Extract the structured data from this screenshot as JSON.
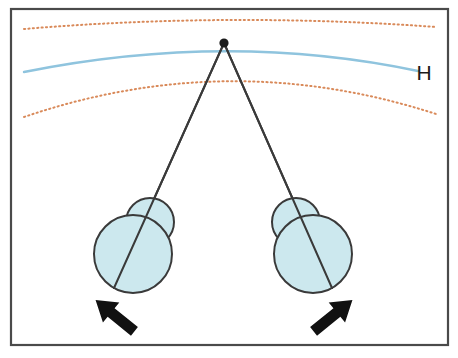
{
  "figure": {
    "type": "optical-geometry-diagram",
    "canvas": {
      "width": 458,
      "height": 358
    },
    "background_color": "#ffffff"
  },
  "frame": {
    "name": "diagram-border",
    "x": 11,
    "y": 9,
    "width": 437,
    "height": 336,
    "stroke_color": "#4a4a4a",
    "stroke_width": 2.2,
    "fill": "#ffffff"
  },
  "curves": [
    {
      "name": "upper-dotted-arc",
      "role": "outer-panum-limit",
      "style": "dotted",
      "color": "#d98a5a",
      "stroke_width": 2.0,
      "dash": "1.2 3.2",
      "path": "M 24 29 Q 229 12 436 27"
    },
    {
      "name": "horopter-curve",
      "role": "horopter",
      "label": "H",
      "style": "solid",
      "color": "#8fc4de",
      "stroke_width": 2.4,
      "path": "M 24 72 Q 228 31 418 71"
    },
    {
      "name": "lower-dotted-arc",
      "role": "inner-panum-limit",
      "style": "dotted",
      "color": "#d98a5a",
      "stroke_width": 2.0,
      "dash": "1.2 3.2",
      "path": "M 24 117 Q 229 47 436 114"
    }
  ],
  "labels": {
    "horopter": {
      "name": "horopter-label",
      "text": "H",
      "x": 424,
      "y": 80,
      "color": "#1b1b1b",
      "font_size": 21
    }
  },
  "fixation_point": {
    "name": "fixation-point",
    "cx": 224,
    "cy": 43,
    "r": 4.6,
    "color": "#1b1b1b"
  },
  "sight_lines": [
    {
      "name": "sight-line-left",
      "x1": 224,
      "y1": 43,
      "x2": 114,
      "y2": 288,
      "color": "#3a3a3a",
      "stroke_width": 2.0
    },
    {
      "name": "sight-line-right",
      "x1": 224,
      "y1": 43,
      "x2": 332,
      "y2": 288,
      "color": "#3a3a3a",
      "stroke_width": 2.0
    }
  ],
  "eyes": [
    {
      "name": "eye-left",
      "side": "left",
      "globe": {
        "cx": 133,
        "cy": 254,
        "r": 39
      },
      "cornea": {
        "cx": 150,
        "cy": 222,
        "r": 24
      },
      "fill": "#cce8ee",
      "stroke": "#3a3a3a",
      "stroke_width": 2.0
    },
    {
      "name": "eye-right",
      "side": "right",
      "globe": {
        "cx": 313,
        "cy": 254,
        "r": 39
      },
      "cornea": {
        "cx": 296,
        "cy": 222,
        "r": 24
      },
      "fill": "#cce8ee",
      "stroke": "#3a3a3a",
      "stroke_width": 2.0
    }
  ],
  "arrows": [
    {
      "name": "arrow-left",
      "direction": "up-right",
      "tail_x": 92,
      "tail_y": 330,
      "tip_x": 124,
      "tip_y": 290,
      "color": "#111111"
    },
    {
      "name": "arrow-right",
      "direction": "up-left",
      "tail_x": 356,
      "tail_y": 330,
      "tip_x": 324,
      "tip_y": 290,
      "color": "#111111"
    }
  ],
  "colors": {
    "eye_fill": "#cce8ee",
    "outline": "#3a3a3a",
    "horopter_blue": "#8fc4de",
    "dotted_orange": "#d98a5a",
    "arrow_black": "#111111",
    "frame_gray": "#4a4a4a"
  }
}
